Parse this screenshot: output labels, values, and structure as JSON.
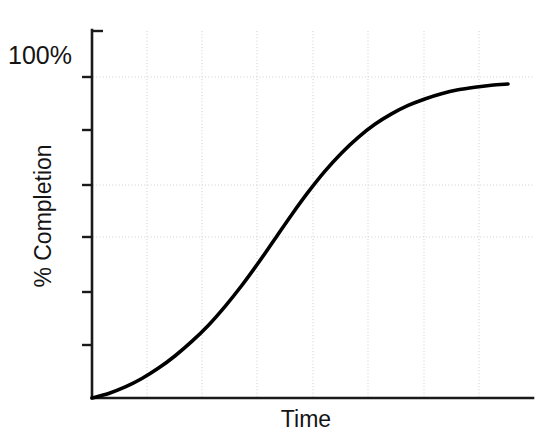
{
  "chart_data": {
    "type": "line",
    "title": "",
    "subtitle": "",
    "xlabel": "Time",
    "ylabel": "% Completion",
    "ymax_label": "100%",
    "grid": true,
    "legend": "none",
    "annotations": [],
    "xlim": [
      0,
      100
    ],
    "ylim": [
      0,
      100
    ],
    "x_tick_labels": [],
    "y_tick_labels": [
      "100%"
    ],
    "series": [
      {
        "name": "% Completion",
        "color": "#000000",
        "x": [
          0,
          4,
          8,
          12,
          16,
          20,
          24,
          28,
          32,
          36,
          40,
          44,
          48,
          52,
          56,
          60,
          64,
          68,
          72,
          76,
          80,
          84,
          88,
          92,
          96,
          100
        ],
        "values": [
          0,
          1.4,
          3.4,
          6.0,
          9.2,
          13.0,
          17.4,
          22.4,
          28.2,
          34.6,
          41.6,
          49.0,
          56.4,
          63.4,
          69.8,
          75.4,
          80.2,
          84.2,
          87.4,
          90.0,
          92.0,
          93.6,
          94.8,
          95.6,
          96.2,
          96.6
        ]
      }
    ]
  },
  "axes": {
    "y_axis_name": "y-axis",
    "x_axis_name": "x-axis",
    "y_tick_count": 7,
    "vertical_gridline_count": 7,
    "horizontal_gridline_count": 3,
    "axis_color": "#1a1a1a",
    "grid_color": "#cfcfcf",
    "curve_color": "#000000",
    "background_color": "#ffffff"
  }
}
